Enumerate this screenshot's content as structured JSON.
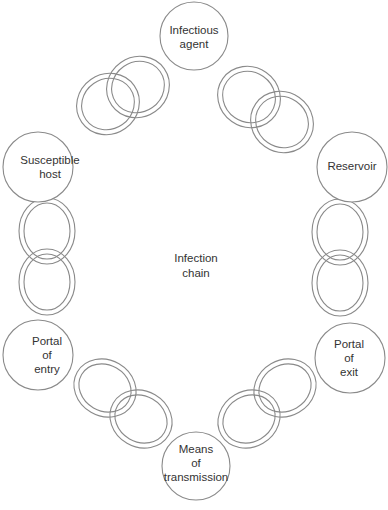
{
  "diagram": {
    "title": "Infection chain",
    "center_label": [
      "Infection",
      "chain"
    ],
    "nodes": [
      {
        "id": "infectious-agent",
        "lines": [
          "Infectious",
          "agent"
        ]
      },
      {
        "id": "reservoir",
        "lines": [
          "Reservoir"
        ]
      },
      {
        "id": "portal-of-exit",
        "lines": [
          "Portal",
          "of",
          "exit"
        ]
      },
      {
        "id": "means-of-transmission",
        "lines": [
          "Means",
          "of",
          "transmission"
        ]
      },
      {
        "id": "portal-of-entry",
        "lines": [
          "Portal",
          "of",
          "entry"
        ]
      },
      {
        "id": "susceptible-host",
        "lines": [
          "Susceptible",
          "host"
        ]
      }
    ],
    "links": [
      {
        "from": "infectious-agent",
        "to": "reservoir"
      },
      {
        "from": "reservoir",
        "to": "portal-of-exit"
      },
      {
        "from": "portal-of-exit",
        "to": "means-of-transmission"
      },
      {
        "from": "means-of-transmission",
        "to": "portal-of-entry"
      },
      {
        "from": "portal-of-entry",
        "to": "susceptible-host"
      },
      {
        "from": "susceptible-host",
        "to": "infectious-agent"
      }
    ],
    "colors": {
      "stroke": "#8a8a8a",
      "text": "#333333",
      "background": "#ffffff"
    }
  }
}
